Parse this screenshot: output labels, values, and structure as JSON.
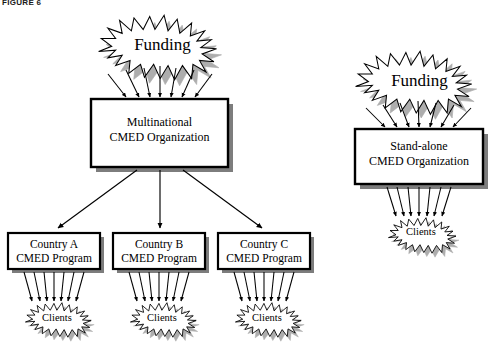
{
  "figure": {
    "label": "FIGURE 6"
  },
  "colors": {
    "outline": "#000000",
    "fill": "#ffffff",
    "shadow": "#8c8c8c",
    "shadow_light": "#a8a8a8",
    "box_shadow": "#7a7a7a",
    "background": "#ffffff"
  },
  "diagram": {
    "type": "organizational-flow",
    "branches": [
      {
        "id": "multinational",
        "name": "Multinational CMED structure",
        "funding": {
          "label": "Funding",
          "shape": "starburst",
          "arrow_count": 7,
          "arrow_direction": "down"
        },
        "organization": {
          "label_line1": "Multinational",
          "label_line2": "CMED Organization",
          "shape": "rectangle-with-shadow"
        },
        "programs": [
          {
            "label_line1": "Country A",
            "label_line2": "CMED Program",
            "clients": {
              "label": "Clients",
              "shape": "starburst",
              "arrow_count": 7
            }
          },
          {
            "label_line1": "Country B",
            "label_line2": "CMED Program",
            "clients": {
              "label": "Clients",
              "shape": "starburst",
              "arrow_count": 7
            }
          },
          {
            "label_line1": "Country C",
            "label_line2": "CMED Program",
            "clients": {
              "label": "Clients",
              "shape": "starburst",
              "arrow_count": 7
            }
          }
        ]
      },
      {
        "id": "standalone",
        "name": "Stand-alone CMED structure",
        "funding": {
          "label": "Funding",
          "shape": "starburst",
          "arrow_count": 7,
          "arrow_direction": "down"
        },
        "organization": {
          "label_line1": "Stand-alone",
          "label_line2": "CMED Organization",
          "shape": "rectangle-with-shadow"
        },
        "clients": {
          "label": "Clients",
          "shape": "starburst",
          "arrow_count": 7
        }
      }
    ]
  }
}
